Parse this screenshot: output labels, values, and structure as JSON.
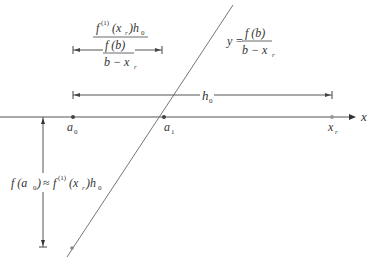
{
  "diagram": {
    "title": "",
    "colors": {
      "line": "#555555",
      "diagonal": "#777777",
      "text": "#333333",
      "point": "#444444",
      "xr_point": "#999999"
    },
    "axis": {
      "label": "x"
    },
    "points": [
      {
        "id": "a0",
        "base": "a",
        "sub": "0"
      },
      {
        "id": "a1",
        "base": "a",
        "sub": "1"
      },
      {
        "id": "xr",
        "base": "x",
        "sub": "r"
      }
    ],
    "line_label": {
      "lhs": "y =",
      "numerator": "f (b)",
      "denominator": "b − x",
      "denominator_sub": "r"
    },
    "h0_dimension": {
      "base": "h",
      "sub": "0"
    },
    "top_dimension": {
      "numerator_f": "f",
      "numerator_sup": "(1)",
      "numerator_arg": "(x",
      "numerator_arg_sub": "r",
      "numerator_arg_close": ")h",
      "numerator_h_sub": "0",
      "middle": "f (b)",
      "denominator": "b − x",
      "denominator_sub": "r"
    },
    "vertical_dimension": {
      "lhs_f": "f (a",
      "lhs_sub": "0",
      "lhs_close": ")",
      "approx": "≈",
      "rhs_f": "f",
      "rhs_sup": "(1)",
      "rhs_arg": "(x",
      "rhs_arg_sub": "r",
      "rhs_close": ")h",
      "rhs_h_sub": "0"
    }
  }
}
